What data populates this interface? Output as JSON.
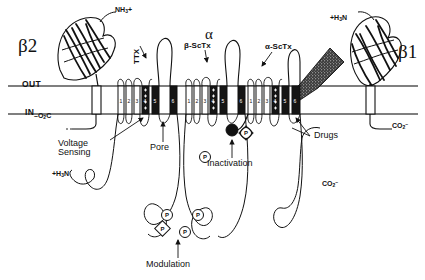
{
  "figure": {
    "membrane": {
      "extracellular_label": "OUT",
      "intracellular_label": "IN"
    },
    "subunits": [
      {
        "id": "beta2",
        "label": "β2",
        "n_terminus": "NH₃+",
        "c_terminus": "–O₂C"
      },
      {
        "id": "alpha",
        "label": "α",
        "n_terminus": "+H₃N",
        "c_terminus": "CO₂⁻"
      },
      {
        "id": "beta1",
        "label": "β1",
        "n_terminus": "+H₃N",
        "c_terminus": "CO₂⁻"
      }
    ],
    "toxin_labels": [
      {
        "name": "ttx",
        "text": "TTX",
        "orientation": "vertical"
      },
      {
        "name": "beta-scorpion-toxin",
        "text": "β-ScTx"
      },
      {
        "name": "alpha-scorpion-toxin",
        "text": "α-ScTx"
      }
    ],
    "function_labels": [
      {
        "name": "voltage-sensing",
        "line1": "Voltage",
        "line2": "Sensing"
      },
      {
        "name": "pore",
        "text": "Pore"
      },
      {
        "name": "inactivation",
        "text": "Inactivation"
      },
      {
        "name": "drugs",
        "text": "Drugs"
      },
      {
        "name": "modulation",
        "text": "Modulation"
      }
    ],
    "segment_numbers": [
      "1",
      "2",
      "3",
      "4",
      "5",
      "6"
    ],
    "phosphorylation_marker": "P",
    "domains": [
      {
        "name": "domain-I",
        "segments": [
          "1",
          "2",
          "3",
          "4",
          "5",
          "6"
        ]
      },
      {
        "name": "domain-II",
        "segments": [
          "1",
          "2",
          "3",
          "4",
          "5",
          "6"
        ]
      },
      {
        "name": "domain-III",
        "segments": [
          "1",
          "2",
          "3",
          "4",
          "5",
          "6"
        ]
      },
      {
        "name": "domain-IV",
        "segments": [
          "1",
          "2",
          "3",
          "4",
          "5",
          "6"
        ]
      }
    ],
    "colors": {
      "ink": "#111111",
      "membrane_line": "#555555",
      "pore_segment_fill": "#1a1a1a",
      "sheet_fill": "#ffffff",
      "background": "#ffffff"
    }
  }
}
